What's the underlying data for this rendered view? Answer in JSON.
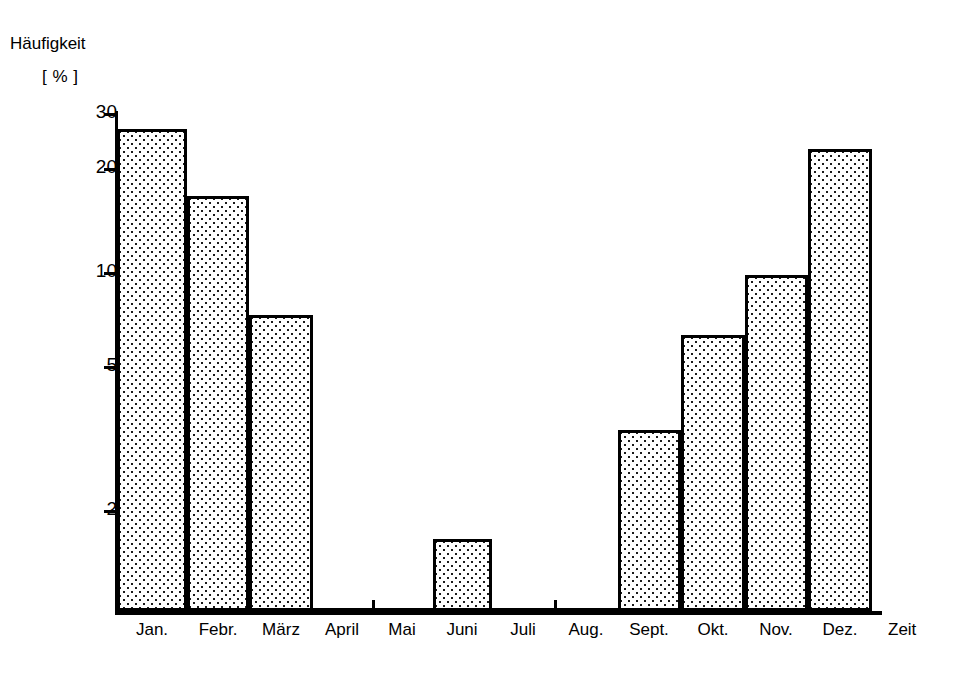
{
  "chart_data": {
    "type": "bar",
    "title": "",
    "subtitle": "",
    "ylabel_line1": "Häufigkeit",
    "ylabel_line2": "[ % ]",
    "xlabel": "Zeit",
    "yscale": "log",
    "ylim": [
      1.3,
      33
    ],
    "grid": false,
    "legend": null,
    "ytick_labels": [
      "30",
      "20",
      "10",
      "5",
      "2"
    ],
    "ytick_values": [
      30,
      20,
      10,
      5,
      2
    ],
    "categories": [
      "Jan.",
      "Febr.",
      "März",
      "April",
      "Mai",
      "Juni",
      "Juli",
      "Aug.",
      "Sept.",
      "Okt.",
      "Nov.",
      "Dez."
    ],
    "values": [
      27.5,
      17,
      7.5,
      0,
      0,
      1.65,
      0,
      0,
      3.1,
      6.6,
      9.6,
      22
    ],
    "bar_fill": "dotted-stipple",
    "bar_edge_color": "#000000",
    "axis_color": "#000000",
    "background": "#ffffff"
  },
  "geometry": {
    "axis_left_px": 115,
    "axis_baseline_px": 611,
    "axis_top_px": 111,
    "axis_right_px": 882,
    "bar_bounds_px": [
      [
        117,
        187
      ],
      [
        187,
        249
      ],
      [
        249,
        313
      ],
      [
        313,
        372
      ],
      [
        372,
        433
      ],
      [
        433,
        492
      ],
      [
        492,
        554
      ],
      [
        554,
        618
      ],
      [
        618,
        681
      ],
      [
        681,
        745
      ],
      [
        745,
        808
      ],
      [
        808,
        872
      ]
    ],
    "bar_top_px": [
      129,
      196,
      315,
      608,
      608,
      539,
      608,
      608,
      430,
      335,
      275,
      149
    ],
    "ytick_px": [
      113,
      168,
      272,
      366,
      510
    ],
    "xtick_px": [
      372,
      554
    ],
    "label_centers_px": [
      152,
      218,
      281,
      342,
      402,
      462,
      523,
      586,
      649,
      713,
      776,
      840
    ]
  }
}
